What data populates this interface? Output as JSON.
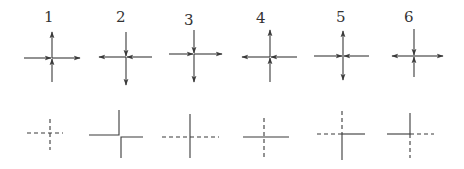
{
  "figure": {
    "colors": {
      "stroke": "#3a3a3a",
      "background": "#ffffff"
    },
    "top_row": [
      {
        "label": "1",
        "cx": 52,
        "cy": 58,
        "x1": 24,
        "x2": 80,
        "y1": 32,
        "y2": 82,
        "arrows": [
          {
            "at": "mid-left",
            "dir": "right"
          },
          {
            "at": "right-end",
            "dir": "right"
          },
          {
            "at": "top-end",
            "dir": "up"
          },
          {
            "at": "mid-bottom",
            "dir": "up"
          }
        ]
      },
      {
        "label": "2",
        "cx": 126,
        "cy": 57,
        "x1": 99,
        "x2": 152,
        "y1": 32,
        "y2": 85,
        "arrows": [
          {
            "at": "left-end",
            "dir": "left"
          },
          {
            "at": "mid-right",
            "dir": "left"
          },
          {
            "at": "mid-top",
            "dir": "down"
          },
          {
            "at": "bottom-end",
            "dir": "down"
          }
        ]
      },
      {
        "label": "3",
        "cx": 194,
        "cy": 54,
        "x1": 169,
        "x2": 222,
        "y1": 30,
        "y2": 82,
        "arrows": [
          {
            "at": "mid-left",
            "dir": "right"
          },
          {
            "at": "right-end",
            "dir": "right"
          },
          {
            "at": "mid-top",
            "dir": "down"
          },
          {
            "at": "bottom-end",
            "dir": "down"
          }
        ]
      },
      {
        "label": "4",
        "cx": 270,
        "cy": 57,
        "x1": 242,
        "x2": 297,
        "y1": 30,
        "y2": 82,
        "arrows": [
          {
            "at": "left-end",
            "dir": "left"
          },
          {
            "at": "mid-right",
            "dir": "left"
          },
          {
            "at": "top-end",
            "dir": "up"
          },
          {
            "at": "mid-bottom",
            "dir": "up"
          }
        ]
      },
      {
        "label": "5",
        "cx": 343,
        "cy": 56,
        "x1": 314,
        "x2": 369,
        "y1": 31,
        "y2": 80,
        "arrows": [
          {
            "at": "mid-left",
            "dir": "right"
          },
          {
            "at": "mid-right",
            "dir": "left"
          },
          {
            "at": "top-end",
            "dir": "up"
          },
          {
            "at": "bottom-end",
            "dir": "down"
          }
        ]
      },
      {
        "label": "6",
        "cx": 414,
        "cy": 56,
        "x1": 392,
        "x2": 443,
        "y1": 29,
        "y2": 77,
        "arrows": [
          {
            "at": "left-end",
            "dir": "left"
          },
          {
            "at": "right-end",
            "dir": "right"
          },
          {
            "at": "mid-top",
            "dir": "down"
          },
          {
            "at": "mid-bottom",
            "dir": "up"
          }
        ]
      }
    ],
    "bottom_row": [
      {
        "id": 1,
        "style": "all dashed cross"
      },
      {
        "id": 2,
        "style": "two solid corners (split crossing)"
      },
      {
        "id": 3,
        "style": "solid vertical, dashed horizontal"
      },
      {
        "id": 4,
        "style": "solid horizontal, dashed vertical"
      },
      {
        "id": 5,
        "style": "dashed top and left, solid right and bottom"
      },
      {
        "id": 6,
        "style": "solid top and left, dashed right and bottom"
      }
    ]
  }
}
